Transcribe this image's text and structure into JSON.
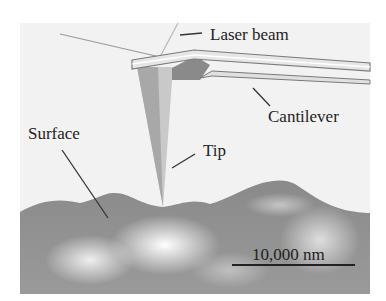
{
  "figure": {
    "type": "diagram",
    "labels": {
      "laser_beam": "Laser beam",
      "cantilever": "Cantilever",
      "surface": "Surface",
      "tip": "Tip",
      "scale_bar": "10,000 nm"
    },
    "colors": {
      "background": "#f2f2f2",
      "tip_light": "#c8c8c8",
      "tip_dark": "#a0a0a0",
      "surface_dark": "#7a7a7a",
      "surface_light": "#e8e8e8",
      "text": "#222222"
    }
  }
}
